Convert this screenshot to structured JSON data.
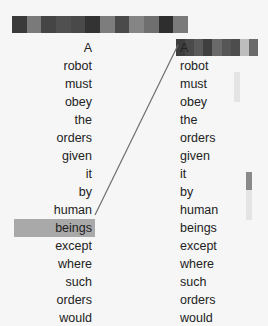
{
  "top_bar": {
    "colors": [
      "#3a3a3a",
      "#7a7a7a",
      "#454545",
      "#505050",
      "#494949",
      "#333333",
      "#7d7d7d",
      "#4a4a4a",
      "#858585",
      "#6f6f6f",
      "#2e2e2e",
      "#7a7a7a"
    ]
  },
  "right_bar": {
    "colors": [
      "#3d3d3d",
      "#4a4a4a",
      "#5a5a5a",
      "#3f3f3f",
      "#6a6a6a",
      "#565656",
      "#4d4d4d",
      "#bdbdbd",
      "#6a6a6a"
    ]
  },
  "left_tokens": [
    "A",
    "robot",
    "must",
    "obey",
    "the",
    "orders",
    "given",
    "it",
    "by",
    "human",
    "beings",
    "except",
    "where",
    "such",
    "orders",
    "would"
  ],
  "right_tokens": [
    "A",
    "robot",
    "must",
    "obey",
    "the",
    "orders",
    "given",
    "it",
    "by",
    "human",
    "beings",
    "except",
    "where",
    "such",
    "orders",
    "would"
  ],
  "selected_left_index": 10,
  "attention_target_index": 0,
  "colors": {
    "highlight": "#a9a9a9",
    "line": "#6e6e6e",
    "marker": "#8a8a8a"
  }
}
